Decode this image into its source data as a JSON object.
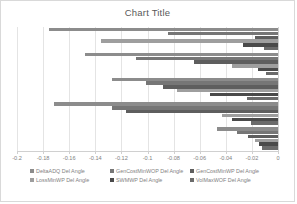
{
  "chart": {
    "title": "Chart Title"
  },
  "axis": {
    "tick_labels": [
      "-0.2",
      "-0.18",
      "-0.16",
      "-0.14",
      "-0.12",
      "-0.1",
      "-0.08",
      "-0.06",
      "-0.04",
      "-0.02",
      "0"
    ]
  },
  "legend": {
    "rows": [
      [
        {
          "label": "DeltaADQ Del Angle",
          "color": "#8c8c8c"
        },
        {
          "label": "GenCostMinWOP Del Angle",
          "color": "#767676"
        },
        {
          "label": "GenCostMinWP Del Angle",
          "color": "#5e5e5e"
        }
      ],
      [
        {
          "label": "LossMinWP Del Angle",
          "color": "#9e9e9e"
        },
        {
          "label": "SWMWP Del Angle",
          "color": "#4a4a4a"
        },
        {
          "label": "VolMaxWOF Del Angle",
          "color": "#6b6b6b"
        }
      ]
    ]
  },
  "chart_data": {
    "type": "bar",
    "orientation": "horizontal",
    "title": "Chart Title",
    "xlabel": "",
    "ylabel": "",
    "xlim": [
      -0.2,
      0
    ],
    "grid": true,
    "legend_position": "bottom",
    "categories": [
      "Group 1",
      "Group 2",
      "Group 3",
      "Group 4",
      "Group 5"
    ],
    "series": [
      {
        "name": "DeltaADQ Del Angle",
        "color": "#8c8c8c",
        "values": [
          -0.1755,
          -0.148,
          -0.1275,
          -0.172,
          -0.0465
        ]
      },
      {
        "name": "GenCostMinWOP Del Angle",
        "color": "#767676",
        "values": [
          -0.084,
          -0.109,
          -0.101,
          -0.127,
          -0.0315
        ]
      },
      {
        "name": "GenCostMinWP Del Angle",
        "color": "#5e5e5e",
        "values": [
          -0.0175,
          -0.064,
          -0.0885,
          -0.1165,
          -0.023
        ]
      },
      {
        "name": "LossMinWP Del Angle",
        "color": "#9e9e9e",
        "values": [
          -0.136,
          -0.0355,
          -0.0775,
          -0.043,
          -0.018
        ]
      },
      {
        "name": "SWMWP Del Angle",
        "color": "#4a4a4a",
        "values": [
          -0.027,
          -0.0155,
          -0.052,
          -0.0355,
          -0.0145
        ]
      },
      {
        "name": "VolMaxWOF Del Angle",
        "color": "#6b6b6b",
        "values": [
          -0.0105,
          -0.0095,
          -0.024,
          -0.021,
          -0.0125
        ]
      }
    ]
  }
}
